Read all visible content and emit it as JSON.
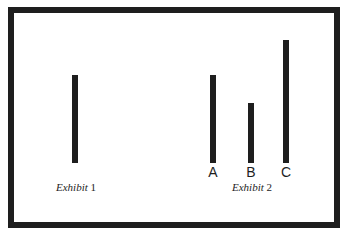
{
  "exhibit1": {
    "caption_word": "Exhibit",
    "caption_num": "1",
    "bars": [
      {
        "label": "",
        "x": 72,
        "top": 75,
        "bottom": 163
      }
    ]
  },
  "exhibit2": {
    "caption_word": "Exhibit",
    "caption_num": "2",
    "bars": [
      {
        "label": "A",
        "x": 210,
        "top": 75,
        "bottom": 163
      },
      {
        "label": "B",
        "x": 248,
        "top": 103,
        "bottom": 163
      },
      {
        "label": "C",
        "x": 283,
        "top": 40,
        "bottom": 163
      }
    ]
  },
  "colors": {
    "line": "#1e1e1e",
    "background": "#ffffff"
  }
}
